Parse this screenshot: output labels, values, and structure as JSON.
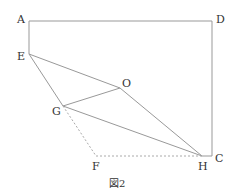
{
  "figure": {
    "caption": "図2",
    "points": {
      "A": {
        "label": "A",
        "x": 29,
        "y": 21
      },
      "D": {
        "label": "D",
        "x": 212,
        "y": 21
      },
      "C": {
        "label": "C",
        "x": 212,
        "y": 156
      },
      "E": {
        "label": "E",
        "x": 29,
        "y": 54
      },
      "O": {
        "label": "O",
        "x": 120,
        "y": 88
      },
      "G": {
        "label": "G",
        "x": 63,
        "y": 106
      },
      "F": {
        "label": "F",
        "x": 96,
        "y": 156
      },
      "H": {
        "label": "H",
        "x": 202,
        "y": 156
      }
    },
    "colors": {
      "line": "#999999",
      "dashed": "#aaaaaa",
      "text": "#333333"
    }
  }
}
